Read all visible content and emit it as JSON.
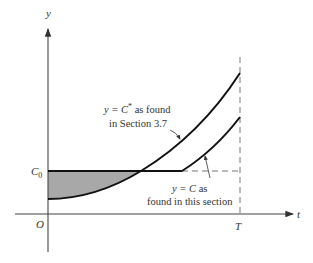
{
  "diagram": {
    "axes": {
      "y_label": "y",
      "x_label": "t",
      "origin_label": "O",
      "c0_label_main": "C",
      "c0_label_sub": "0",
      "T_label": "T"
    },
    "annotations": {
      "cstar": {
        "line1_prefix": "y = C",
        "line1_sup": "*",
        "line1_suffix": " as found",
        "line2": "in Section 3.7"
      },
      "c": {
        "line1_prefix": "y = C",
        "line1_suffix": " as",
        "line2": "found in this section"
      }
    },
    "colors": {
      "curve": "#111111",
      "axis": "#444444",
      "dashed": "#777777",
      "shade": "#a8a8a8"
    }
  }
}
